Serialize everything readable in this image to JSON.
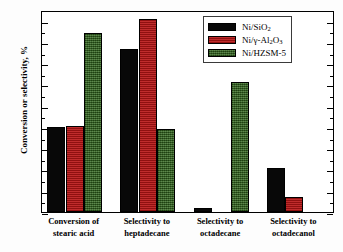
{
  "chart_data": {
    "type": "bar",
    "title": "",
    "xlabel": "",
    "ylabel": "Conversion or selectivity, %",
    "ylim": [
      0,
      95
    ],
    "ytick_step": 10,
    "ytick_labels": [
      "0",
      "10",
      "20",
      "30",
      "40",
      "50",
      "60",
      "70",
      "80",
      "90"
    ],
    "grid": false,
    "legend_position": "top-right",
    "categories": [
      "Conversion of stearic acid",
      "Selectivity to heptadecane",
      "Selectivity to octadecane",
      "Selectivity to octadecanol"
    ],
    "category_lines": [
      [
        "Conversion of",
        "stearic acid"
      ],
      [
        "Selectivity to",
        "heptadecane"
      ],
      [
        "Selectivity to",
        "octadecane"
      ],
      [
        "Selectivity to",
        "octadecanol"
      ]
    ],
    "series": [
      {
        "name": "Ni/SiO2",
        "name_parts": [
          "Ni/SiO",
          "2",
          ""
        ],
        "color": "#080808",
        "values": [
          40.2,
          76.5,
          2.0,
          20.5
        ]
      },
      {
        "name": "Ni/γ-Al2O3",
        "name_parts": [
          "Ni/γ-Al",
          "2",
          "O",
          "3"
        ],
        "color": "#b81414",
        "values": [
          40.3,
          90.8,
          0,
          7.0
        ]
      },
      {
        "name": "Ni/HZSM-5",
        "name_parts": [
          "Ni/HZSM-5",
          "",
          ""
        ],
        "color": "#2d6318",
        "values": [
          84.2,
          39.0,
          61.0,
          0
        ]
      }
    ]
  },
  "legend": {
    "items": [
      {
        "label_main": "Ni/SiO",
        "sub1": "2",
        "mid": "",
        "sub2": ""
      },
      {
        "label_main": "Ni/γ-Al",
        "sub1": "2",
        "mid": "O",
        "sub2": "3"
      },
      {
        "label_main": "Ni/HZSM-5",
        "sub1": "",
        "mid": "",
        "sub2": ""
      }
    ]
  },
  "axes": {
    "y_title": "Conversion or selectivity, %"
  }
}
